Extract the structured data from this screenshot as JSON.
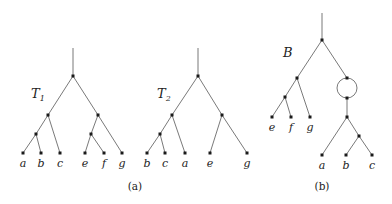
{
  "figure": {
    "captions": {
      "a": "(a)",
      "b": "(b)"
    },
    "trees": {
      "T1": {
        "label": "T",
        "subscript": "1",
        "leaves": [
          "a",
          "b",
          "c",
          "e",
          "f",
          "g"
        ]
      },
      "T2": {
        "label": "T",
        "subscript": "2",
        "leaves": [
          "b",
          "c",
          "a",
          "e",
          "g"
        ]
      },
      "B": {
        "label": "B",
        "leaves_left": [
          "e",
          "f",
          "g"
        ],
        "leaves_right": [
          "a",
          "b",
          "c"
        ],
        "has_cycle": true
      }
    },
    "colors": {
      "edge": "#6a6a6a",
      "node": "#1a1a1a",
      "text": "#222222"
    }
  }
}
